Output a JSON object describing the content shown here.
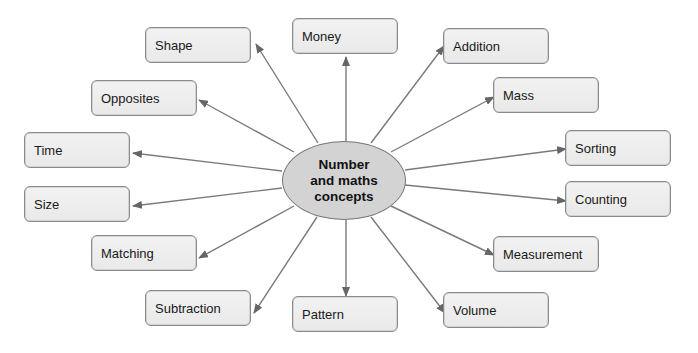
{
  "diagram": {
    "type": "mind-map",
    "center": {
      "lines": [
        "Number",
        "and maths",
        "concepts"
      ],
      "fill": "#d3d3d3"
    },
    "line_color": "#7a7a7a",
    "arrow_color": "#6a6a6a",
    "box_fill": "#eeeeee",
    "nodes": [
      {
        "label": "Shape",
        "x": 145,
        "y": 27,
        "from": [
          318,
          143
        ],
        "to": [
          256,
          44
        ]
      },
      {
        "label": "Money",
        "x": 292,
        "y": 18,
        "from": [
          346,
          141
        ],
        "to": [
          346,
          57
        ]
      },
      {
        "label": "Addition",
        "x": 443,
        "y": 28,
        "from": [
          371,
          143
        ],
        "to": [
          444,
          46
        ]
      },
      {
        "label": "Mass",
        "x": 493,
        "y": 77,
        "from": [
          391,
          152
        ],
        "to": [
          494,
          97
        ]
      },
      {
        "label": "Sorting",
        "x": 565,
        "y": 130,
        "from": [
          405,
          170
        ],
        "to": [
          566,
          149
        ]
      },
      {
        "label": "Counting",
        "x": 565,
        "y": 181,
        "from": [
          405,
          185
        ],
        "to": [
          566,
          201
        ]
      },
      {
        "label": "Measurement",
        "x": 493,
        "y": 236,
        "from": [
          391,
          206
        ],
        "to": [
          494,
          255
        ]
      },
      {
        "label": "Volume",
        "x": 443,
        "y": 292,
        "from": [
          371,
          217
        ],
        "to": [
          445,
          313
        ]
      },
      {
        "label": "Pattern",
        "x": 292,
        "y": 296,
        "from": [
          346,
          220
        ],
        "to": [
          346,
          296
        ]
      },
      {
        "label": "Subtraction",
        "x": 145,
        "y": 290,
        "from": [
          317,
          217
        ],
        "to": [
          254,
          313
        ]
      },
      {
        "label": "Matching",
        "x": 91,
        "y": 235,
        "from": [
          294,
          206
        ],
        "to": [
          199,
          258
        ]
      },
      {
        "label": "Size",
        "x": 24,
        "y": 186,
        "from": [
          282,
          188
        ],
        "to": [
          133,
          206
        ]
      },
      {
        "label": "Time",
        "x": 24,
        "y": 132,
        "from": [
          282,
          171
        ],
        "to": [
          133,
          153
        ]
      },
      {
        "label": "Opposites",
        "x": 91,
        "y": 80,
        "from": [
          294,
          152
        ],
        "to": [
          199,
          100
        ]
      }
    ]
  }
}
